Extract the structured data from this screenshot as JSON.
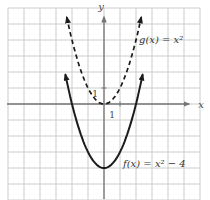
{
  "figure": {
    "axis_x_label": "x",
    "axis_y_label": "y",
    "x_unit_label": "1",
    "y_unit_label": "1",
    "g_label": "g(x) = x²",
    "f_label": "f(x) = x² − 4",
    "colors": {
      "background": "#ffffff",
      "grid": "#cacecb",
      "axis": "#757575",
      "curve": "#1b1b1b",
      "label_text": "#363636"
    }
  },
  "chart_data": {
    "type": "line",
    "title": "",
    "xlabel": "x",
    "ylabel": "y",
    "xlim": [
      -6,
      6.3
    ],
    "ylim": [
      -6,
      6
    ],
    "grid": true,
    "grid_spacing": 1,
    "labeled_ticks": [
      {
        "axis": "x",
        "value": 1,
        "label": "1"
      },
      {
        "axis": "y",
        "value": 1,
        "label": "1"
      }
    ],
    "transform": {
      "origin_px": [
        104,
        104
      ],
      "px_per_unit": 16,
      "grid_start_px": 8,
      "grid_end_px": 200
    },
    "series": [
      {
        "name": "g(x) = x²",
        "style": "dashed",
        "color": "#1b1b1b",
        "coeffs": {
          "a": 1,
          "b": 0,
          "c": 0
        },
        "x_draw_range": [
          -2.33,
          2.33
        ],
        "x": [
          -2,
          -1.5,
          -1,
          -0.5,
          0,
          0.5,
          1,
          1.5,
          2
        ],
        "y": [
          4,
          2.25,
          1,
          0.25,
          0,
          0.25,
          1,
          2.25,
          4
        ],
        "arrows": "both-ends-up"
      },
      {
        "name": "f(x) = x² − 4",
        "style": "solid",
        "color": "#1b1b1b",
        "coeffs": {
          "a": 1,
          "b": 0,
          "c": -4
        },
        "x_draw_range": [
          -2.42,
          2.42
        ],
        "x": [
          -2,
          -1.5,
          -1,
          -0.5,
          0,
          0.5,
          1,
          1.5,
          2
        ],
        "y": [
          0,
          -1.75,
          -3,
          -3.75,
          -4,
          -3.75,
          -3,
          -1.75,
          0
        ],
        "arrows": "both-ends-up"
      }
    ]
  }
}
